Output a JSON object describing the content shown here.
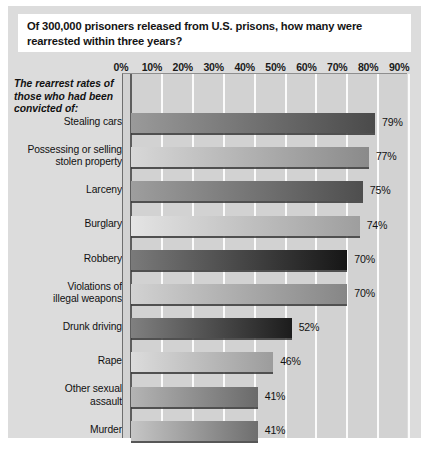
{
  "figure": {
    "title": "Of 300,000 prisoners released from U.S. prisons, how many were rearrested within three years?",
    "axis_caption": "The rearrest rates of those who had been convicted of:",
    "panel_background": "#dcdcdc",
    "plot_background": "#d2d2d2",
    "gridline_color": "#fbfbfb",
    "axis_color": "#5e5e5e"
  },
  "chart_data": {
    "type": "bar",
    "orientation": "horizontal",
    "title": "Of 300,000 prisoners released from U.S. prisons, how many were rearrested within three years?",
    "xlabel": "",
    "ylabel": "The rearrest rates of those who had been convicted of:",
    "xlim": [
      0,
      90
    ],
    "xtick_labels": [
      "0%",
      "10%",
      "20%",
      "30%",
      "40%",
      "50%",
      "60%",
      "70%",
      "80%",
      "90%"
    ],
    "xticks": [
      0,
      10,
      20,
      30,
      40,
      50,
      60,
      70,
      80,
      90
    ],
    "grid": true,
    "legend": "none",
    "value_suffix": "%",
    "categories": [
      "Stealing cars",
      "Possessing or selling stolen property",
      "Larceny",
      "Burglary",
      "Robbery",
      "Violations of illegal weapons",
      "Drunk driving",
      "Rape",
      "Other sexual assault",
      "Murder"
    ],
    "values": [
      79,
      77,
      75,
      74,
      70,
      70,
      52,
      46,
      41,
      41
    ],
    "value_labels": [
      "79%",
      "77%",
      "75%",
      "74%",
      "70%",
      "70%",
      "52%",
      "46%",
      "41%",
      "41%"
    ],
    "bars": [
      {
        "label": "Stealing cars",
        "label_lines": [
          "Stealing cars"
        ],
        "value": 79,
        "value_label": "79%",
        "fill_start": "#9a9a9a",
        "fill_end": "#4a4a4a"
      },
      {
        "label": "Possessing or selling stolen property",
        "label_lines": [
          "Possessing or selling",
          "stolen property"
        ],
        "value": 77,
        "value_label": "77%",
        "fill_start": "#d8d8d8",
        "fill_end": "#8a8a8a"
      },
      {
        "label": "Larceny",
        "label_lines": [
          "Larceny"
        ],
        "value": 75,
        "value_label": "75%",
        "fill_start": "#9e9e9e",
        "fill_end": "#4e4e4e"
      },
      {
        "label": "Burglary",
        "label_lines": [
          "Burglary"
        ],
        "value": 74,
        "value_label": "74%",
        "fill_start": "#e4e4e4",
        "fill_end": "#9e9e9e"
      },
      {
        "label": "Robbery",
        "label_lines": [
          "Robbery"
        ],
        "value": 70,
        "value_label": "70%",
        "fill_start": "#7a7a7a",
        "fill_end": "#161616"
      },
      {
        "label": "Violations of illegal weapons",
        "label_lines": [
          "Violations of",
          "illegal weapons"
        ],
        "value": 70,
        "value_label": "70%",
        "fill_start": "#d2d2d2",
        "fill_end": "#868686"
      },
      {
        "label": "Drunk driving",
        "label_lines": [
          "Drunk driving"
        ],
        "value": 52,
        "value_label": "52%",
        "fill_start": "#808080",
        "fill_end": "#1c1c1c"
      },
      {
        "label": "Rape",
        "label_lines": [
          "Rape"
        ],
        "value": 46,
        "value_label": "46%",
        "fill_start": "#dcdcdc",
        "fill_end": "#9c9c9c"
      },
      {
        "label": "Other sexual assault",
        "label_lines": [
          "Other sexual",
          "assault"
        ],
        "value": 41,
        "value_label": "41%",
        "fill_start": "#b4b4b4",
        "fill_end": "#6a6a6a"
      },
      {
        "label": "Murder",
        "label_lines": [
          "Murder"
        ],
        "value": 41,
        "value_label": "41%",
        "fill_start": "#c6c6c6",
        "fill_end": "#6e6e6e"
      }
    ]
  }
}
